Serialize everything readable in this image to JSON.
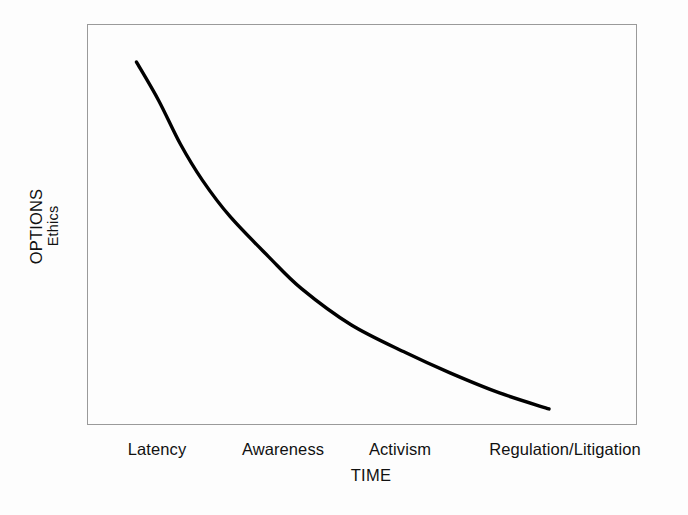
{
  "figure": {
    "background_color": "#fdfdfd",
    "frame_color": "#9a9a9a",
    "curve_color": "#000000"
  },
  "y_axis": {
    "title_primary": "OPTIONS",
    "title_secondary": "Ethics"
  },
  "x_axis": {
    "title": "TIME",
    "ticks": [
      {
        "label": "Latency"
      },
      {
        "label": "Awareness"
      },
      {
        "label": "Activism"
      },
      {
        "label": "Regulation/Litigation"
      }
    ]
  },
  "chart_data": {
    "type": "line",
    "title": "",
    "xlabel": "TIME",
    "ylabel": "OPTIONS / Ethics",
    "grid": false,
    "legend": "none",
    "annotations": [],
    "categories": [
      "Latency",
      "Awareness",
      "Activism",
      "Regulation/Litigation"
    ],
    "xlim": [
      0,
      1
    ],
    "ylim": [
      0,
      1
    ],
    "series": [
      {
        "name": "Options available",
        "description": "Monotonic decaying curve: options/ethical latitude fall sharply as societal response moves from Latency through Awareness and Activism to Regulation/Litigation.",
        "x": [
          0.09,
          0.13,
          0.17,
          0.21,
          0.26,
          0.33,
          0.39,
          0.48,
          0.58,
          0.66,
          0.75,
          0.84
        ],
        "y": [
          0.905,
          0.81,
          0.7,
          0.61,
          0.52,
          0.42,
          0.34,
          0.25,
          0.18,
          0.13,
          0.08,
          0.04
        ]
      }
    ]
  }
}
